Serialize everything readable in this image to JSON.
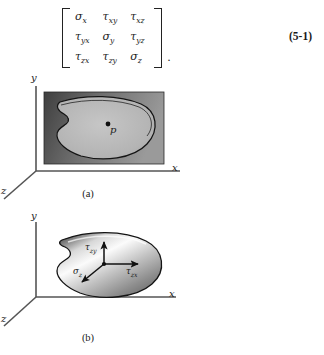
{
  "equation": {
    "number": "(5-1)",
    "trailing_punctuation": ".",
    "matrix": [
      [
        {
          "sym": "σ",
          "sub": "x"
        },
        {
          "sym": "τ",
          "sub": "xy"
        },
        {
          "sym": "τ",
          "sub": "xz"
        }
      ],
      [
        {
          "sym": "τ",
          "sub": "yx"
        },
        {
          "sym": "σ",
          "sub": "y"
        },
        {
          "sym": "τ",
          "sub": "yz"
        }
      ],
      [
        {
          "sym": "τ",
          "sub": "zx"
        },
        {
          "sym": "τ",
          "sub": "zy"
        },
        {
          "sym": "σ",
          "sub": "z"
        }
      ]
    ],
    "cells_flat": [
      "σx",
      "τxy",
      "τxz",
      "τyx",
      "σy",
      "τyz",
      "τzx",
      "τzy",
      "σz"
    ]
  },
  "figure_a": {
    "caption": "(a)",
    "axes": {
      "x": "x",
      "y": "y",
      "z": "z"
    },
    "point_label": "p",
    "description": "cutting plane rectangle with irregular cross-section blob and interior point p",
    "colors": {
      "plane_fill_dark": "#4d4d4d",
      "plane_fill_light": "#8f8f8f",
      "blob_fill": "#b9b9b9",
      "outline": "#141414",
      "axis": "#555555"
    }
  },
  "figure_b": {
    "caption": "(b)",
    "axes": {
      "x": "x",
      "y": "y",
      "z": "z"
    },
    "stresses": [
      {
        "sym": "τ",
        "sub": "zy",
        "direction": "up"
      },
      {
        "sym": "τ",
        "sub": "zx",
        "direction": "right"
      },
      {
        "sym": "σ",
        "sub": "z",
        "direction": "down-left"
      }
    ],
    "description": "shaded cross-section blob with three stress-component vectors at point p",
    "colors": {
      "blob_light": "#f2f2f2",
      "blob_mid": "#b5b5b5",
      "blob_dark": "#6a6a6a",
      "outline": "#141414",
      "axis": "#555555"
    }
  }
}
